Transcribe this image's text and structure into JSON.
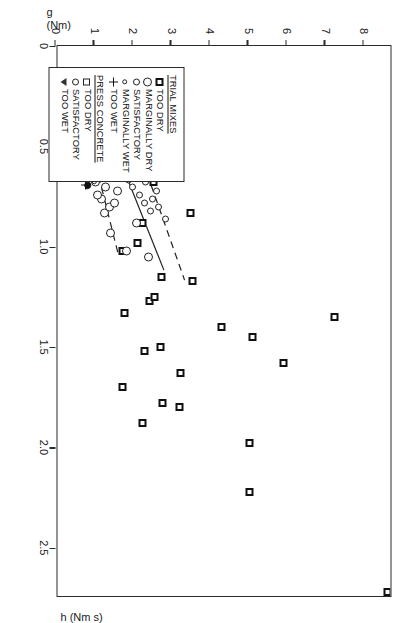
{
  "chart_data": {
    "type": "scatter",
    "title": "",
    "xlabel": "h (Nm s)",
    "ylabel_line1": "g",
    "ylabel_line2": "(Nm)",
    "xlim": [
      0,
      2.75
    ],
    "ylim": [
      0,
      8.7
    ],
    "xticks": [
      0,
      0.5,
      1.0,
      1.5,
      2.0,
      2.5
    ],
    "xticklabels": [
      "0",
      "0.5",
      "1.0",
      "1.5",
      "2.0",
      "2.5"
    ],
    "yticks": [
      0,
      1,
      2,
      3,
      4,
      5,
      6,
      7,
      8
    ],
    "yticklabels": [
      "0",
      "1",
      "2",
      "3",
      "4",
      "5",
      "6",
      "7",
      "8"
    ],
    "grid": false,
    "legend_position": "lower-left",
    "series": [
      {
        "name": "TRIAL MIXES - TOO DRY",
        "marker": "square-bold",
        "points": [
          [
            2.72,
            8.62
          ],
          [
            2.22,
            5.05
          ],
          [
            1.98,
            5.05
          ],
          [
            1.88,
            2.25
          ],
          [
            1.8,
            3.22
          ],
          [
            1.78,
            2.78
          ],
          [
            1.7,
            1.75
          ],
          [
            1.63,
            3.25
          ],
          [
            1.58,
            5.92
          ],
          [
            1.52,
            2.3
          ],
          [
            1.5,
            2.72
          ],
          [
            1.45,
            5.12
          ],
          [
            1.4,
            4.32
          ],
          [
            1.35,
            7.25
          ],
          [
            1.33,
            1.8
          ],
          [
            1.27,
            2.45
          ],
          [
            1.25,
            2.58
          ],
          [
            1.17,
            3.55
          ],
          [
            1.15,
            2.75
          ],
          [
            1.02,
            1.75
          ],
          [
            0.98,
            2.12
          ],
          [
            0.88,
            2.25
          ],
          [
            0.83,
            3.5
          ],
          [
            0.68,
            2.55
          ],
          [
            0.57,
            2.9
          ]
        ]
      },
      {
        "name": "TRIAL MIXES - MARGINALLY DRY",
        "marker": "circle-large",
        "points": [
          [
            1.05,
            2.42
          ],
          [
            1.02,
            1.85
          ],
          [
            0.93,
            1.42
          ],
          [
            0.88,
            2.1
          ],
          [
            0.83,
            1.28
          ],
          [
            0.8,
            1.4
          ],
          [
            0.78,
            1.52
          ],
          [
            0.76,
            1.2
          ],
          [
            0.74,
            1.08
          ],
          [
            0.72,
            1.62
          ],
          [
            0.7,
            1.3
          ],
          [
            0.68,
            1.05
          ]
        ]
      },
      {
        "name": "TRIAL MIXES - SATISFACTORY",
        "marker": "circle",
        "points": [
          [
            0.86,
            2.85
          ],
          [
            0.82,
            2.48
          ],
          [
            0.8,
            2.68
          ],
          [
            0.78,
            2.3
          ],
          [
            0.76,
            2.52
          ],
          [
            0.74,
            2.18
          ],
          [
            0.72,
            2.62
          ],
          [
            0.7,
            2.0
          ],
          [
            0.68,
            2.33
          ],
          [
            0.67,
            1.9
          ],
          [
            0.66,
            2.2
          ],
          [
            0.64,
            2.42
          ],
          [
            0.63,
            1.78
          ],
          [
            0.62,
            2.1
          ],
          [
            0.61,
            2.6
          ],
          [
            0.6,
            1.95
          ],
          [
            0.59,
            2.3
          ],
          [
            0.58,
            1.7
          ],
          [
            0.57,
            2.05
          ],
          [
            0.56,
            2.45
          ],
          [
            0.55,
            1.85
          ],
          [
            0.54,
            2.18
          ],
          [
            0.53,
            1.62
          ],
          [
            0.52,
            2.0
          ],
          [
            0.51,
            2.32
          ],
          [
            0.5,
            1.75
          ],
          [
            0.49,
            2.08
          ],
          [
            0.48,
            1.55
          ],
          [
            0.47,
            1.92
          ],
          [
            0.46,
            2.22
          ],
          [
            0.45,
            1.68
          ],
          [
            0.44,
            2.02
          ],
          [
            0.43,
            1.48
          ],
          [
            0.42,
            1.82
          ],
          [
            0.41,
            2.12
          ],
          [
            0.4,
            1.6
          ],
          [
            0.39,
            1.95
          ],
          [
            0.38,
            1.42
          ],
          [
            0.37,
            1.75
          ],
          [
            0.36,
            2.05
          ],
          [
            0.35,
            1.55
          ],
          [
            0.34,
            1.32
          ],
          [
            0.33,
            1.68
          ],
          [
            0.32,
            1.88
          ]
        ]
      },
      {
        "name": "TRIAL MIXES - MARGINALLY WET",
        "marker": "circle-small",
        "points": [
          [
            0.7,
            0.82
          ],
          [
            0.68,
            1.02
          ],
          [
            0.64,
            0.88
          ],
          [
            0.6,
            1.12
          ],
          [
            0.56,
            0.95
          ],
          [
            0.52,
            1.18
          ],
          [
            0.49,
            1.05
          ],
          [
            0.46,
            1.22
          ],
          [
            0.43,
            1.1
          ],
          [
            0.4,
            1.28
          ],
          [
            0.38,
            1.15
          ]
        ]
      },
      {
        "name": "TRIAL MIXES - TOO WET",
        "marker": "plus",
        "points": [
          [
            0.69,
            0.78
          ],
          [
            0.58,
            0.72
          ],
          [
            0.56,
            0.62
          ],
          [
            0.49,
            0.52
          ],
          [
            0.47,
            0.6
          ],
          [
            0.45,
            0.45
          ],
          [
            0.43,
            0.55
          ]
        ]
      },
      {
        "name": "PRESS CONCRETE - TOO DRY",
        "marker": "square",
        "points": [
          [
            0.62,
            2.92
          ],
          [
            0.57,
            2.58
          ],
          [
            0.53,
            2.72
          ],
          [
            0.5,
            2.4
          ],
          [
            0.47,
            2.6
          ],
          [
            0.44,
            2.28
          ],
          [
            0.41,
            2.48
          ],
          [
            0.38,
            2.35
          ]
        ]
      },
      {
        "name": "PRESS CONCRETE - SATISFACTORY",
        "marker": "circle-filled",
        "points": [
          [
            0.69,
            0.83
          ],
          [
            0.55,
            1.82
          ],
          [
            0.52,
            1.92
          ],
          [
            0.5,
            1.48
          ],
          [
            0.47,
            1.7
          ],
          [
            0.45,
            1.38
          ],
          [
            0.42,
            1.6
          ]
        ]
      },
      {
        "name": "PRESS CONCRETE - TOO WET",
        "marker": "triangle-down",
        "points": [
          [
            0.52,
            1.28
          ],
          [
            0.49,
            1.42
          ],
          [
            0.46,
            1.18
          ],
          [
            0.43,
            1.32
          ],
          [
            0.4,
            1.22
          ],
          [
            0.37,
            1.35
          ]
        ]
      }
    ],
    "trend_lines": [
      {
        "name": "upper-bound",
        "style": "dashed",
        "x0": 0.3,
        "y0": 1.72,
        "x1": 1.17,
        "y1": 3.32
      },
      {
        "name": "best-fit",
        "style": "solid",
        "x0": 0.24,
        "y0": 0.95,
        "x1": 1.12,
        "y1": 2.78
      },
      {
        "name": "lower-bound",
        "style": "dashed",
        "x0": 0.3,
        "y0": 0.62,
        "x1": 1.05,
        "y1": 1.6
      }
    ]
  },
  "legend": {
    "groups": [
      {
        "title": "TRIAL MIXES",
        "entries": [
          {
            "marker": "square-bold",
            "label": "TOO DRY"
          },
          {
            "marker": "circle-large",
            "label": "MARGINALLY DRY"
          },
          {
            "marker": "circle",
            "label": "SATISFACTORY"
          },
          {
            "marker": "circle-small",
            "label": "MARGINALLY WET"
          },
          {
            "marker": "plus",
            "label": "TOO WET"
          }
        ]
      },
      {
        "title": "PRESS CONCRETE",
        "entries": [
          {
            "marker": "square",
            "label": "TOO DRY"
          },
          {
            "marker": "circle",
            "label": "SATISFACTORY"
          },
          {
            "marker": "triangle-down",
            "label": "TOO WET"
          }
        ]
      }
    ]
  }
}
